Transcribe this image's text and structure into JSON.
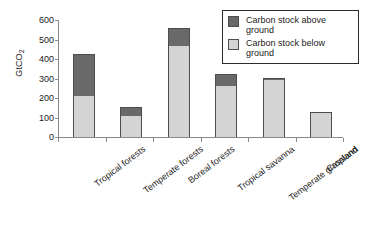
{
  "chart_data": {
    "type": "bar",
    "subtype": "stacked",
    "title": "",
    "xlabel": "",
    "ylabel": "GtCO2",
    "ylabel_display": "GtCO",
    "ylabel_subscript": "2",
    "ylim": [
      0,
      600
    ],
    "ytick_step": 100,
    "yticks": [
      0,
      100,
      200,
      300,
      400,
      500,
      600
    ],
    "ytick_labels": [
      "0",
      "100",
      "200",
      "300",
      "400",
      "500",
      "600"
    ],
    "grid": false,
    "legend_position": "top-right",
    "categories": [
      "Tropical forests",
      "Temperate forests",
      "Boreal forests",
      "Tropical savanna",
      "Temperate grassland",
      "Cropland"
    ],
    "series": [
      {
        "name": "Carbon stock below ground",
        "color": "#d4d4d4",
        "values": [
          212,
          110,
          465,
          262,
          290,
          130
        ]
      },
      {
        "name": "Carbon stock above ground",
        "color": "#696969",
        "values": [
          213,
          43,
          92,
          63,
          5,
          0
        ]
      }
    ],
    "totals": [
      425,
      153,
      557,
      325,
      295,
      130
    ]
  },
  "legend": {
    "entries": [
      {
        "label": "Carbon stock above ground",
        "swatch": "above"
      },
      {
        "label": "Carbon stock below ground",
        "swatch": "below"
      }
    ]
  },
  "colors": {
    "above_ground": "#696969",
    "below_ground": "#d4d4d4",
    "axis": "#8a8a8a",
    "bar_border": "#4d4d4d",
    "legend_border": "#2b2b2b",
    "text": "#1a1a1a",
    "background": "#ffffff"
  }
}
